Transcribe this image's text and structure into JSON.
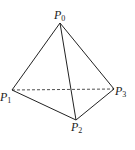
{
  "diagram": {
    "vertices": [
      {
        "id": "P0",
        "base": "P",
        "sub": "0",
        "x": 60,
        "y": 23
      },
      {
        "id": "P1",
        "base": "P",
        "sub": "1",
        "x": 12,
        "y": 90
      },
      {
        "id": "P2",
        "base": "P",
        "sub": "2",
        "x": 76,
        "y": 120
      },
      {
        "id": "P3",
        "base": "P",
        "sub": "3",
        "x": 114,
        "y": 89
      }
    ],
    "edges": [
      {
        "from": "P0",
        "to": "P1",
        "style": "solid"
      },
      {
        "from": "P0",
        "to": "P2",
        "style": "solid"
      },
      {
        "from": "P0",
        "to": "P3",
        "style": "solid"
      },
      {
        "from": "P1",
        "to": "P2",
        "style": "solid"
      },
      {
        "from": "P2",
        "to": "P3",
        "style": "solid"
      },
      {
        "from": "P1",
        "to": "P3",
        "style": "dashed"
      }
    ],
    "labels": {
      "p0": {
        "base": "P",
        "sub": "0"
      },
      "p1": {
        "base": "P",
        "sub": "1"
      },
      "p2": {
        "base": "P",
        "sub": "2"
      },
      "p3": {
        "base": "P",
        "sub": "3"
      }
    }
  }
}
